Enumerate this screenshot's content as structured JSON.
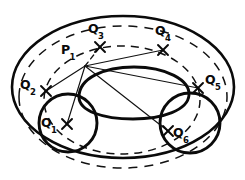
{
  "figure": {
    "kind": "geometric-diagram",
    "background_color": "#ffffff",
    "ink_color": "#0a0a0a"
  },
  "points": [
    {
      "id": "P1",
      "base": "P",
      "sub": "1",
      "mark_x": 85,
      "mark_y": 66,
      "label_x": 61,
      "label_y": 44,
      "has_cross": false
    },
    {
      "id": "Q1",
      "base": "Q",
      "sub": "1",
      "mark_x": 67,
      "mark_y": 124,
      "label_x": 41,
      "label_y": 117,
      "has_cross": true
    },
    {
      "id": "Q2",
      "base": "Q",
      "sub": "2",
      "mark_x": 46,
      "mark_y": 91,
      "label_x": 20,
      "label_y": 79,
      "has_cross": true
    },
    {
      "id": "Q3",
      "base": "Q",
      "sub": "3",
      "mark_x": 100,
      "mark_y": 47,
      "label_x": 88,
      "label_y": 23,
      "has_cross": true
    },
    {
      "id": "Q4",
      "base": "Q",
      "sub": "4",
      "mark_x": 163,
      "mark_y": 50,
      "label_x": 155,
      "label_y": 25,
      "has_cross": true
    },
    {
      "id": "Q5",
      "base": "Q",
      "sub": "5",
      "mark_x": 198,
      "mark_y": 88,
      "label_x": 205,
      "label_y": 74,
      "has_cross": true
    },
    {
      "id": "Q6",
      "base": "Q",
      "sub": "6",
      "mark_x": 168,
      "mark_y": 131,
      "label_x": 173,
      "label_y": 127,
      "has_cross": true
    }
  ],
  "shapes": {
    "outer_oval": {
      "cx": 123,
      "cy": 87,
      "rx": 111,
      "ry": 71,
      "style": "solid-thick"
    },
    "dashed_outer_oval": {
      "cx": 123,
      "cy": 97,
      "rx": 104,
      "ry": 71,
      "style": "dashed"
    },
    "dashed_inner_oval": {
      "cx": 122,
      "cy": 100,
      "rx": 78,
      "ry": 54,
      "style": "dashed"
    },
    "center_blob": {
      "cx": 133,
      "cy": 93,
      "rx": 56,
      "ry": 26,
      "style": "solid-thick"
    },
    "left_circle": {
      "cx": 68,
      "cy": 123,
      "r": 29,
      "style": "solid-thick"
    },
    "right_circle": {
      "cx": 190,
      "cy": 123,
      "r": 30,
      "style": "solid-thick"
    }
  },
  "segments": [
    {
      "name": "p1-to-q1",
      "from": "P1",
      "to": "Q1",
      "style": "solid"
    },
    {
      "name": "p1-to-q2",
      "from": "P1",
      "to": "Q2",
      "style": "solid"
    },
    {
      "name": "p1-to-q3",
      "from": "P1",
      "to": "Q3",
      "style": "solid"
    },
    {
      "name": "p1-to-q4",
      "from": "P1",
      "to": "Q4",
      "style": "solid"
    },
    {
      "name": "p1-to-q5",
      "from": "P1",
      "to": "Q5",
      "style": "solid"
    },
    {
      "name": "p1-to-q6",
      "from": "P1",
      "to": "Q6",
      "style": "solid"
    }
  ]
}
